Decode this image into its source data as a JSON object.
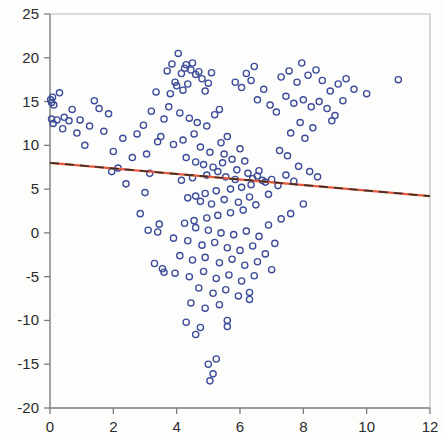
{
  "chart_data": {
    "type": "scatter",
    "title": "",
    "xlabel": "",
    "ylabel": "",
    "xlim": [
      0,
      12
    ],
    "ylim": [
      -20,
      25
    ],
    "grid": false,
    "legend": null,
    "x_ticks": [
      0,
      2,
      4,
      6,
      8,
      10,
      12
    ],
    "y_ticks": [
      25,
      20,
      15,
      10,
      5,
      0,
      -5,
      -10,
      -15,
      -20
    ],
    "x_tick_labels": [
      "0",
      "2",
      "4",
      "6",
      "8",
      "10",
      "12"
    ],
    "y_tick_labels": [
      "25",
      "20",
      "15",
      "10",
      "5",
      "0",
      "-5",
      "-10",
      "-15",
      "-20"
    ],
    "marker": {
      "shape": "open-circle",
      "radius": 3.1,
      "edge_color": "#3c4c9a",
      "fill_color": "none"
    },
    "series": [
      {
        "name": "observations",
        "type": "scatter",
        "color": "#3c4c9a",
        "points": [
          [
            0.02,
            15.2
          ],
          [
            0.05,
            14.9
          ],
          [
            0.08,
            15.5
          ],
          [
            0.12,
            14.6
          ],
          [
            0.3,
            16.0
          ],
          [
            0.05,
            13.0
          ],
          [
            0.22,
            12.9
          ],
          [
            0.1,
            12.5
          ],
          [
            0.45,
            13.2
          ],
          [
            0.6,
            12.8
          ],
          [
            0.95,
            12.9
          ],
          [
            1.25,
            12.2
          ],
          [
            1.4,
            15.1
          ],
          [
            1.55,
            14.2
          ],
          [
            1.7,
            11.6
          ],
          [
            0.85,
            11.4
          ],
          [
            1.1,
            10.0
          ],
          [
            2.0,
            9.3
          ],
          [
            2.15,
            7.4
          ],
          [
            1.95,
            7.0
          ],
          [
            2.4,
            5.6
          ],
          [
            2.75,
            11.3
          ],
          [
            2.95,
            12.3
          ],
          [
            3.05,
            9.0
          ],
          [
            3.2,
            13.9
          ],
          [
            3.35,
            16.1
          ],
          [
            3.5,
            11.0
          ],
          [
            3.6,
            13.0
          ],
          [
            3.4,
            10.4
          ],
          [
            3.15,
            6.8
          ],
          [
            3.0,
            4.6
          ],
          [
            2.85,
            2.2
          ],
          [
            3.1,
            0.3
          ],
          [
            3.3,
            -3.5
          ],
          [
            3.6,
            -4.5
          ],
          [
            3.45,
            1.0
          ],
          [
            3.7,
            18.5
          ],
          [
            3.85,
            19.3
          ],
          [
            3.95,
            17.2
          ],
          [
            4.05,
            20.5
          ],
          [
            4.15,
            18.2
          ],
          [
            4.25,
            18.8
          ],
          [
            4.3,
            19.2
          ],
          [
            4.45,
            18.6
          ],
          [
            4.5,
            19.4
          ],
          [
            4.6,
            18.1
          ],
          [
            4.7,
            18.4
          ],
          [
            4.8,
            17.6
          ],
          [
            4.35,
            17.0
          ],
          [
            4.2,
            16.3
          ],
          [
            4.0,
            16.8
          ],
          [
            3.8,
            15.9
          ],
          [
            4.9,
            16.2
          ],
          [
            5.1,
            18.3
          ],
          [
            5.0,
            17.1
          ],
          [
            3.75,
            14.4
          ],
          [
            4.1,
            13.7
          ],
          [
            4.4,
            13.1
          ],
          [
            4.65,
            12.6
          ],
          [
            4.95,
            12.2
          ],
          [
            5.2,
            13.5
          ],
          [
            5.35,
            14.1
          ],
          [
            4.55,
            11.3
          ],
          [
            4.2,
            10.6
          ],
          [
            3.9,
            10.1
          ],
          [
            4.75,
            9.8
          ],
          [
            5.05,
            9.2
          ],
          [
            5.4,
            10.3
          ],
          [
            5.6,
            11.0
          ],
          [
            5.5,
            9.0
          ],
          [
            4.3,
            8.6
          ],
          [
            4.6,
            8.1
          ],
          [
            4.85,
            7.8
          ],
          [
            5.15,
            7.5
          ],
          [
            5.45,
            8.0
          ],
          [
            5.75,
            8.4
          ],
          [
            6.0,
            9.6
          ],
          [
            6.15,
            8.2
          ],
          [
            5.9,
            7.2
          ],
          [
            5.3,
            7.0
          ],
          [
            4.95,
            6.6
          ],
          [
            4.5,
            6.3
          ],
          [
            4.15,
            6.0
          ],
          [
            5.55,
            6.4
          ],
          [
            5.85,
            6.1
          ],
          [
            6.25,
            6.8
          ],
          [
            6.4,
            6.2
          ],
          [
            6.55,
            6.5
          ],
          [
            6.7,
            6.0
          ],
          [
            6.6,
            7.1
          ],
          [
            6.35,
            5.5
          ],
          [
            6.05,
            5.2
          ],
          [
            5.7,
            5.0
          ],
          [
            5.25,
            4.8
          ],
          [
            4.9,
            4.5
          ],
          [
            4.6,
            4.2
          ],
          [
            4.35,
            4.0
          ],
          [
            4.75,
            3.6
          ],
          [
            5.1,
            3.3
          ],
          [
            5.5,
            3.8
          ],
          [
            5.95,
            3.5
          ],
          [
            6.3,
            4.1
          ],
          [
            6.8,
            5.8
          ],
          [
            7.0,
            6.1
          ],
          [
            7.2,
            5.4
          ],
          [
            7.45,
            6.6
          ],
          [
            7.7,
            5.9
          ],
          [
            6.9,
            4.4
          ],
          [
            6.5,
            3.2
          ],
          [
            6.1,
            2.6
          ],
          [
            5.7,
            2.3
          ],
          [
            5.3,
            2.0
          ],
          [
            4.95,
            1.7
          ],
          [
            4.55,
            1.4
          ],
          [
            4.25,
            1.1
          ],
          [
            4.6,
            0.6
          ],
          [
            5.0,
            0.3
          ],
          [
            5.4,
            0.0
          ],
          [
            5.8,
            -0.2
          ],
          [
            6.2,
            0.2
          ],
          [
            6.6,
            -0.4
          ],
          [
            6.9,
            0.9
          ],
          [
            7.3,
            1.6
          ],
          [
            7.6,
            2.2
          ],
          [
            8.0,
            3.3
          ],
          [
            3.4,
            0.1
          ],
          [
            3.9,
            -0.6
          ],
          [
            4.35,
            -0.9
          ],
          [
            4.8,
            -1.4
          ],
          [
            5.2,
            -1.1
          ],
          [
            5.6,
            -1.7
          ],
          [
            6.0,
            -2.0
          ],
          [
            6.4,
            -1.5
          ],
          [
            6.8,
            -2.4
          ],
          [
            7.1,
            -1.2
          ],
          [
            4.1,
            -2.6
          ],
          [
            4.5,
            -3.1
          ],
          [
            4.9,
            -2.8
          ],
          [
            5.35,
            -3.4
          ],
          [
            5.75,
            -3.0
          ],
          [
            6.15,
            -3.7
          ],
          [
            6.55,
            -3.3
          ],
          [
            3.55,
            -4.1
          ],
          [
            3.95,
            -4.6
          ],
          [
            4.4,
            -5.0
          ],
          [
            4.85,
            -4.4
          ],
          [
            5.25,
            -5.2
          ],
          [
            5.65,
            -4.8
          ],
          [
            6.05,
            -5.5
          ],
          [
            6.45,
            -4.9
          ],
          [
            7.0,
            -4.2
          ],
          [
            4.7,
            -6.3
          ],
          [
            5.15,
            -6.9
          ],
          [
            5.55,
            -6.5
          ],
          [
            5.95,
            -7.2
          ],
          [
            4.45,
            -8.0
          ],
          [
            4.9,
            -8.6
          ],
          [
            5.35,
            -8.2
          ],
          [
            6.3,
            -6.8
          ],
          [
            6.3,
            -7.6
          ],
          [
            4.3,
            -10.2
          ],
          [
            4.75,
            -10.8
          ],
          [
            5.6,
            -10.0
          ],
          [
            5.6,
            -10.7
          ],
          [
            4.6,
            -11.6
          ],
          [
            5.0,
            -15.0
          ],
          [
            5.15,
            -16.1
          ],
          [
            5.05,
            -16.9
          ],
          [
            5.25,
            -14.4
          ],
          [
            7.3,
            17.8
          ],
          [
            7.55,
            18.5
          ],
          [
            7.8,
            17.2
          ],
          [
            7.95,
            19.4
          ],
          [
            8.15,
            18.0
          ],
          [
            8.4,
            18.6
          ],
          [
            8.6,
            17.4
          ],
          [
            8.85,
            16.2
          ],
          [
            9.1,
            17.0
          ],
          [
            9.35,
            17.6
          ],
          [
            7.45,
            15.6
          ],
          [
            7.7,
            14.8
          ],
          [
            8.0,
            15.2
          ],
          [
            8.25,
            14.4
          ],
          [
            8.5,
            15.0
          ],
          [
            8.75,
            14.2
          ],
          [
            9.0,
            13.4
          ],
          [
            7.15,
            13.8
          ],
          [
            6.95,
            14.6
          ],
          [
            6.75,
            16.4
          ],
          [
            6.55,
            15.2
          ],
          [
            6.35,
            17.4
          ],
          [
            6.2,
            18.2
          ],
          [
            6.45,
            19.0
          ],
          [
            6.05,
            16.6
          ],
          [
            5.85,
            17.2
          ],
          [
            7.9,
            12.6
          ],
          [
            8.3,
            12.0
          ],
          [
            7.6,
            11.4
          ],
          [
            8.05,
            10.8
          ],
          [
            11.0,
            17.5
          ],
          [
            10.0,
            15.9
          ],
          [
            9.6,
            16.4
          ],
          [
            9.25,
            15.1
          ],
          [
            8.9,
            12.8
          ],
          [
            7.25,
            9.4
          ],
          [
            7.5,
            8.8
          ],
          [
            7.85,
            7.6
          ],
          [
            8.2,
            7.0
          ],
          [
            8.45,
            6.4
          ],
          [
            2.6,
            8.6
          ],
          [
            2.3,
            10.8
          ],
          [
            1.85,
            13.6
          ],
          [
            0.7,
            14.1
          ],
          [
            0.4,
            11.9
          ]
        ]
      }
    ],
    "fit_lines": [
      {
        "name": "regression-line-solid",
        "style": "solid",
        "color": "#e8583f",
        "x_start": 0,
        "y_start": 8.0,
        "x_end": 12,
        "y_end": 4.2
      },
      {
        "name": "regression-line-dashed",
        "style": "dashed",
        "color": "#3a3027",
        "x_start": 0,
        "y_start": 8.0,
        "x_end": 12,
        "y_end": 4.2
      }
    ]
  }
}
